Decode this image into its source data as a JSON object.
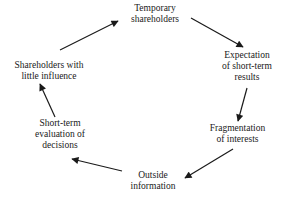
{
  "diagram": {
    "type": "cycle",
    "nodes": [
      {
        "id": "temporary-shareholders",
        "lines": [
          "Temporary",
          "shareholders"
        ]
      },
      {
        "id": "expectation-short-term-results",
        "lines": [
          "Expectation",
          "of short-term",
          "results"
        ]
      },
      {
        "id": "fragmentation-of-interests",
        "lines": [
          "Fragmentation",
          "of interests"
        ]
      },
      {
        "id": "outside-information",
        "lines": [
          "Outside",
          "information"
        ]
      },
      {
        "id": "short-term-evaluation",
        "lines": [
          "Short-term",
          "evaluation of",
          "decisions"
        ]
      },
      {
        "id": "shareholders-little-influence",
        "lines": [
          "Shareholders with",
          "little influence"
        ]
      }
    ],
    "edges": [
      {
        "from": "temporary-shareholders",
        "to": "expectation-short-term-results"
      },
      {
        "from": "expectation-short-term-results",
        "to": "fragmentation-of-interests"
      },
      {
        "from": "fragmentation-of-interests",
        "to": "outside-information"
      },
      {
        "from": "outside-information",
        "to": "short-term-evaluation"
      },
      {
        "from": "short-term-evaluation",
        "to": "shareholders-little-influence"
      },
      {
        "from": "shareholders-little-influence",
        "to": "temporary-shareholders"
      }
    ],
    "colors": {
      "arrow": "#1a1a1a",
      "text": "#1a1a1a",
      "background": "#ffffff"
    }
  }
}
